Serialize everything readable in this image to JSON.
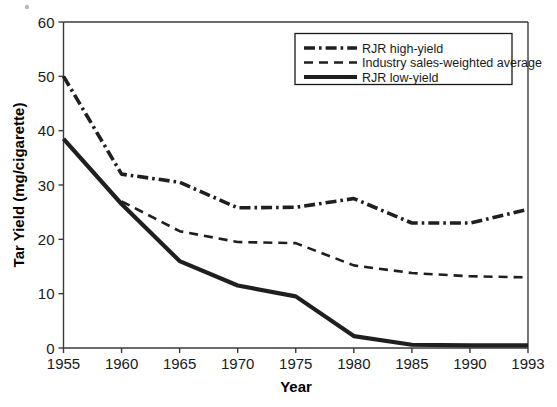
{
  "chart_data": {
    "type": "line",
    "title": "",
    "xlabel": "Year",
    "ylabel": "Tar Yield (mg/cigarette)",
    "x": [
      "1955",
      "1960",
      "1965",
      "1970",
      "1975",
      "1980",
      "1985",
      "1990",
      "1993"
    ],
    "categories": [
      "1955",
      "1960",
      "1965",
      "1970",
      "1975",
      "1980",
      "1985",
      "1990",
      "1993"
    ],
    "xticklabels": [
      "1955",
      "1960",
      "1965",
      "1970",
      "1975",
      "1980",
      "1985",
      "1990",
      "1993"
    ],
    "yticklabels": [
      "0",
      "10",
      "20",
      "30",
      "40",
      "50",
      "60"
    ],
    "yticks": [
      0,
      10,
      20,
      30,
      40,
      50,
      60
    ],
    "ylim": [
      0,
      60
    ],
    "xlim": [
      0,
      8
    ],
    "grid": false,
    "legend_position": "top-right",
    "series": [
      {
        "name": "RJR high-yield",
        "style": "dash-dot",
        "color": "#1f1f1f",
        "values": [
          50.0,
          32.0,
          30.5,
          25.8,
          25.9,
          27.5,
          23.0,
          23.0,
          25.5
        ]
      },
      {
        "name": "Industry sales-weighted average",
        "style": "dashed",
        "color": "#1f1f1f",
        "values": [
          null,
          27.0,
          21.5,
          19.5,
          19.3,
          15.2,
          13.8,
          13.2,
          13.0
        ]
      },
      {
        "name": "RJR low-yield",
        "style": "solid",
        "color": "#1f1f1f",
        "values": [
          38.5,
          26.5,
          16.0,
          11.5,
          9.5,
          2.2,
          0.6,
          0.5,
          0.5
        ]
      }
    ]
  },
  "legend": {
    "entries": [
      {
        "label": "RJR high-yield"
      },
      {
        "label": "Industry sales-weighted average"
      },
      {
        "label": "RJR low-yield"
      }
    ]
  },
  "axes": {
    "x_title": "Year",
    "y_title": "Tar Yield (mg/cigarette)"
  }
}
